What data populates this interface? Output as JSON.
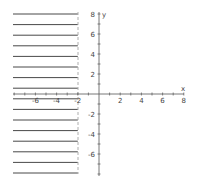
{
  "chart_data": {
    "type": "inequality-graph",
    "title": "",
    "inequality": "x <= -2",
    "boundary": {
      "type": "vertical",
      "x": -2,
      "style": "dashed"
    },
    "shaded_side": "left",
    "xlabel": "x",
    "ylabel": "y",
    "xlim": [
      -8,
      8
    ],
    "ylim": [
      -8,
      8
    ],
    "x_ticks": [
      -6,
      -4,
      -2,
      2,
      4,
      6,
      8
    ],
    "y_ticks": [
      8,
      6,
      4,
      2,
      -2,
      -4,
      -6
    ],
    "grid": false,
    "colors": {
      "axis": "#555555",
      "hatch": "#333333",
      "boundary": "#888888"
    }
  },
  "axes": {
    "x_label": "x",
    "y_label": "y",
    "x_tick_labels": [
      "-6",
      "-4",
      "-2",
      "2",
      "4",
      "6",
      "8"
    ],
    "y_tick_labels": [
      "8",
      "6",
      "4",
      "2",
      "-2",
      "-4",
      "-6"
    ]
  }
}
